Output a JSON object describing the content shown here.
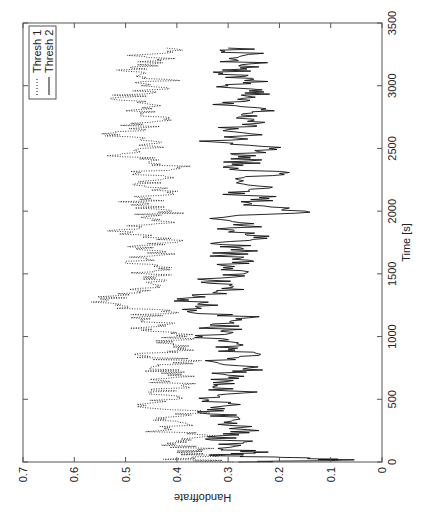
{
  "chart_data": {
    "type": "line",
    "title": "",
    "xlabel": "Time [s]",
    "ylabel": "Handoffrate",
    "xlim": [
      0,
      3500
    ],
    "ylim": [
      0,
      0.7
    ],
    "xticks": [
      0,
      500,
      1000,
      1500,
      2000,
      2500,
      3000,
      3500
    ],
    "yticks": [
      0,
      0.1,
      0.2,
      0.3,
      0.4,
      0.5,
      0.6,
      0.7
    ],
    "grid": false,
    "legend_position": "upper left",
    "orientation": "figure rotated 90 degrees counterclockwise",
    "series": [
      {
        "name": "Thresh 1",
        "style": "dotted",
        "x": [
          0,
          25,
          50,
          75,
          100,
          150,
          200,
          250,
          300,
          350,
          400,
          450,
          500,
          550,
          600,
          650,
          700,
          750,
          800,
          850,
          900,
          950,
          1000,
          1050,
          1100,
          1150,
          1200,
          1250,
          1300,
          1350,
          1400,
          1450,
          1500,
          1550,
          1600,
          1650,
          1700,
          1750,
          1800,
          1850,
          1900,
          1950,
          2000,
          2050,
          2100,
          2150,
          2200,
          2250,
          2300,
          2350,
          2400,
          2450,
          2500,
          2550,
          2600,
          2650,
          2700,
          2750,
          2800,
          2850,
          2900,
          2950,
          3000,
          3050,
          3100,
          3150,
          3200,
          3250,
          3300
        ],
        "values": [
          0.29,
          0.41,
          0.33,
          0.4,
          0.36,
          0.42,
          0.35,
          0.43,
          0.38,
          0.44,
          0.36,
          0.46,
          0.4,
          0.45,
          0.38,
          0.43,
          0.39,
          0.45,
          0.37,
          0.47,
          0.4,
          0.44,
          0.38,
          0.47,
          0.41,
          0.49,
          0.43,
          0.52,
          0.55,
          0.47,
          0.44,
          0.42,
          0.46,
          0.41,
          0.5,
          0.43,
          0.48,
          0.4,
          0.46,
          0.52,
          0.44,
          0.47,
          0.41,
          0.49,
          0.45,
          0.42,
          0.46,
          0.43,
          0.48,
          0.4,
          0.45,
          0.51,
          0.47,
          0.43,
          0.54,
          0.46,
          0.49,
          0.42,
          0.5,
          0.45,
          0.53,
          0.44,
          0.47,
          0.42,
          0.46,
          0.49,
          0.43,
          0.46,
          0.42
        ]
      },
      {
        "name": "Thresh 2",
        "style": "solid",
        "x": [
          0,
          15,
          30,
          50,
          75,
          100,
          150,
          200,
          250,
          300,
          350,
          400,
          450,
          500,
          550,
          600,
          650,
          700,
          750,
          800,
          850,
          900,
          950,
          1000,
          1050,
          1100,
          1150,
          1200,
          1250,
          1300,
          1350,
          1400,
          1450,
          1500,
          1550,
          1600,
          1650,
          1700,
          1750,
          1800,
          1850,
          1900,
          1950,
          2000,
          2050,
          2100,
          2150,
          2200,
          2250,
          2300,
          2350,
          2400,
          2450,
          2500,
          2550,
          2600,
          2650,
          2700,
          2750,
          2800,
          2850,
          2900,
          2950,
          3000,
          3050,
          3100,
          3150,
          3200,
          3250,
          3300
        ],
        "values": [
          0.28,
          0.08,
          0.14,
          0.33,
          0.25,
          0.31,
          0.27,
          0.34,
          0.24,
          0.32,
          0.28,
          0.36,
          0.3,
          0.34,
          0.27,
          0.33,
          0.29,
          0.31,
          0.26,
          0.33,
          0.24,
          0.3,
          0.28,
          0.35,
          0.31,
          0.33,
          0.26,
          0.38,
          0.32,
          0.4,
          0.33,
          0.29,
          0.34,
          0.27,
          0.31,
          0.25,
          0.3,
          0.27,
          0.32,
          0.22,
          0.29,
          0.25,
          0.31,
          0.15,
          0.27,
          0.22,
          0.3,
          0.24,
          0.28,
          0.2,
          0.31,
          0.26,
          0.29,
          0.22,
          0.32,
          0.27,
          0.3,
          0.24,
          0.28,
          0.21,
          0.33,
          0.27,
          0.23,
          0.3,
          0.25,
          0.31,
          0.24,
          0.28,
          0.26,
          0.3
        ]
      }
    ]
  },
  "legend": {
    "items": [
      {
        "label": "Thresh 1",
        "style": "dotted"
      },
      {
        "label": "Thresh 2",
        "style": "solid"
      }
    ]
  },
  "axes": {
    "xlabel": "Time [s]",
    "ylabel": "Handoffrate",
    "xtick_labels": [
      "0",
      "500",
      "1000",
      "1500",
      "2000",
      "2500",
      "3000",
      "3500"
    ],
    "ytick_labels": [
      "0",
      "0.1",
      "0.2",
      "0.3",
      "0.4",
      "0.5",
      "0.6",
      "0.7"
    ]
  },
  "colors": {
    "line": "#111111",
    "axis": "#555555",
    "background": "#ffffff"
  }
}
